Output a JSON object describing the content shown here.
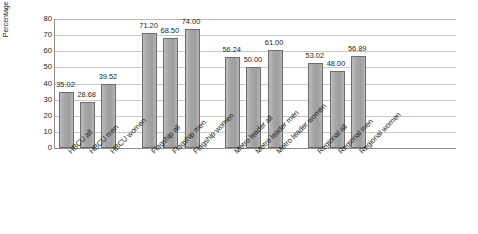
{
  "chart_data": {
    "type": "bar",
    "title": "",
    "subtitle": "",
    "xlabel": "",
    "ylabel": "Percentage increase in graduation rate",
    "ylim": [
      0,
      80
    ],
    "yticks": [
      0,
      10,
      20,
      30,
      40,
      50,
      60,
      70,
      80
    ],
    "ytick_labels": [
      "0",
      "10",
      "20",
      "30",
      "40",
      "50",
      "60",
      "70",
      "80"
    ],
    "grid": true,
    "legend": "none",
    "bar_color": "#a7a7a7",
    "bar_border_color": "#6d6d6d",
    "gridline_color": "#c9c9c9",
    "axis_color": "#8d8d8d",
    "categories": [
      "HBCU all",
      "HBCU men",
      "HBCU women",
      "Flagship all",
      "Flagship men",
      "Flagship women",
      "Metro leader all",
      "Metro leader men",
      "Metro leader women",
      "Regional all",
      "Regional men",
      "Regional women"
    ],
    "values": [
      35.02,
      28.68,
      39.52,
      71.2,
      68.5,
      74.0,
      56.24,
      50.0,
      61.0,
      53.02,
      48.0,
      56.89
    ],
    "value_labels": [
      "35.02",
      "28.68",
      "39.52",
      "71.20",
      "68.50",
      "74.00",
      "56.24",
      "50.00",
      "61.00",
      "53.02",
      "48.00",
      "56.89"
    ],
    "groups": [
      {
        "name": "HBCU",
        "categories": [
          "HBCU all",
          "HBCU men",
          "HBCU women"
        ]
      },
      {
        "name": "Flagship",
        "categories": [
          "Flagship all",
          "Flagship men",
          "Flagship women"
        ]
      },
      {
        "name": "Metro leader",
        "categories": [
          "Metro leader all",
          "Metro leader men",
          "Metro leader women"
        ]
      },
      {
        "name": "Regional",
        "categories": [
          "Regional all",
          "Regional men",
          "Regional women"
        ]
      }
    ]
  }
}
